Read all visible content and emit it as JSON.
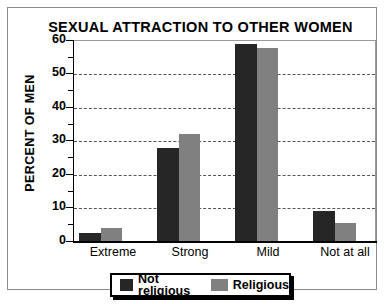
{
  "chart_data": {
    "type": "bar",
    "title": "SEXUAL ATTRACTION TO OTHER WOMEN",
    "xlabel": "",
    "ylabel": "PERCENT OF MEN",
    "ylim": [
      0,
      60
    ],
    "ytick_step": 10,
    "yminor_step": 5,
    "grid": true,
    "grid_axis": "y",
    "grid_style": "dashed",
    "legend_position": "bottom",
    "categories": [
      "Extreme",
      "Strong",
      "Mild",
      "Not at all"
    ],
    "ytick_labels": [
      "0",
      "10",
      "20",
      "30",
      "40",
      "50",
      "60"
    ],
    "series": [
      {
        "name": "Not religious",
        "color": "#262626",
        "values": [
          2.5,
          28,
          59,
          9
        ]
      },
      {
        "name": "Religious",
        "color": "#808080",
        "values": [
          4,
          32,
          58,
          5.5
        ]
      }
    ]
  },
  "legend": {
    "items": [
      {
        "label": "Not religious"
      },
      {
        "label": "Religious"
      }
    ]
  }
}
